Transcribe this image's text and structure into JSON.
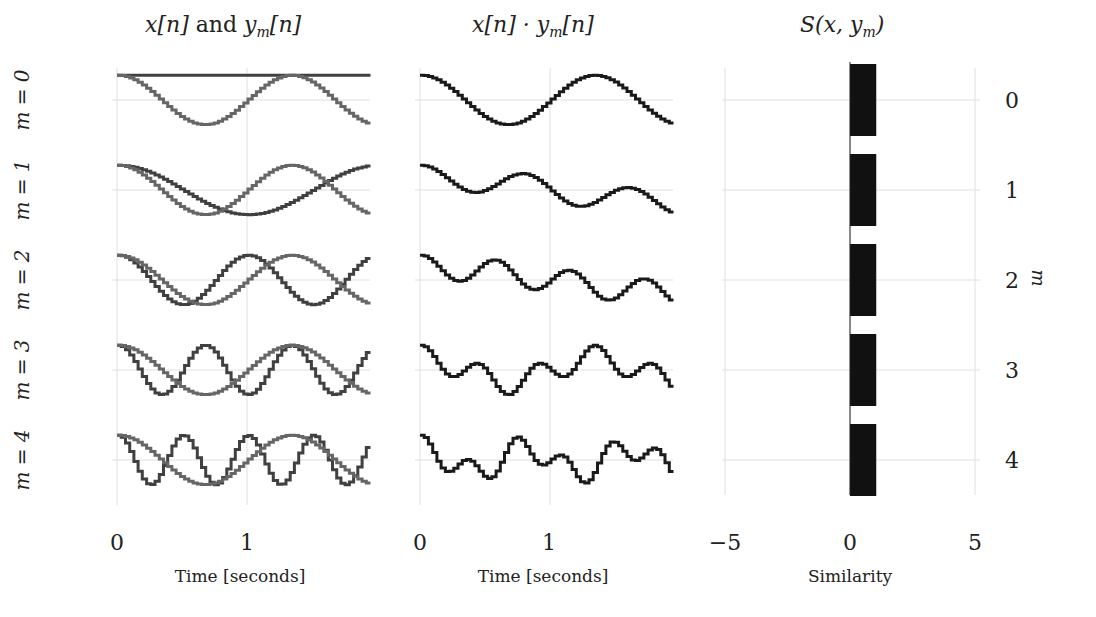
{
  "panels": {
    "left": {
      "title": "x[n] and y_m[n]",
      "title_parts": [
        "x[n]",
        " and ",
        "y",
        "m",
        "[n]"
      ],
      "xlabel": "Time [seconds]",
      "xticks": [
        "0",
        "1"
      ]
    },
    "middle": {
      "title": "x[n] · y_m[n]",
      "title_parts": [
        "x[n] · y",
        "m",
        "[n]"
      ],
      "xlabel": "Time [seconds]",
      "xticks": [
        "0",
        "1"
      ]
    },
    "right": {
      "title": "S(x, y_m)",
      "title_parts": [
        "S(x, y",
        "m",
        ")"
      ],
      "xlabel": "Similarity",
      "xticks": [
        "−5",
        "0",
        "5"
      ],
      "ylabel": "m",
      "yticks": [
        "0",
        "1",
        "2",
        "3",
        "4"
      ]
    }
  },
  "row_labels": [
    "m = 0",
    "m = 1",
    "m = 2",
    "m = 3",
    "m = 4"
  ],
  "colors": {
    "x_signal": "#4d4d4d",
    "y_signal": "#5a5a5a",
    "product": "#1a1a1a",
    "bar": "#111111",
    "grid": "#e0e0e0"
  },
  "chart_data": [
    {
      "type": "line",
      "title": "x[n] and y_m[n]",
      "xlabel": "Time [seconds]",
      "xlim": [
        0,
        1.95
      ],
      "xticks": [
        0,
        1
      ],
      "grid": true,
      "step_style": "stairs",
      "series": [
        {
          "name": "x[n]",
          "formula": "cos(2*pi*0.75*t)",
          "frequency_hz": 0.75
        },
        {
          "name": "y_0[n]",
          "formula": "cos(2*pi*0*t)",
          "frequency_hz": 0.0
        },
        {
          "name": "y_1[n]",
          "formula": "cos(2*pi*0.5*t)",
          "frequency_hz": 0.5
        },
        {
          "name": "y_2[n]",
          "formula": "cos(2*pi*1.0*t)",
          "frequency_hz": 1.0
        },
        {
          "name": "y_3[n]",
          "formula": "cos(2*pi*1.5*t)",
          "frequency_hz": 1.5
        },
        {
          "name": "y_4[n]",
          "formula": "cos(2*pi*2.0*t)",
          "frequency_hz": 2.0
        }
      ],
      "rows": [
        "m = 0",
        "m = 1",
        "m = 2",
        "m = 3",
        "m = 4"
      ]
    },
    {
      "type": "line",
      "title": "x[n] · y_m[n]",
      "xlabel": "Time [seconds]",
      "xlim": [
        0,
        1.95
      ],
      "xticks": [
        0,
        1
      ],
      "grid": true,
      "series": [
        {
          "name": "x·y_0",
          "m": 0
        },
        {
          "name": "x·y_1",
          "m": 1
        },
        {
          "name": "x·y_2",
          "m": 2
        },
        {
          "name": "x·y_3",
          "m": 3
        },
        {
          "name": "x·y_4",
          "m": 4
        }
      ]
    },
    {
      "type": "bar",
      "orientation": "horizontal",
      "title": "S(x, y_m)",
      "xlabel": "Similarity",
      "ylabel": "m",
      "categories": [
        "0",
        "1",
        "2",
        "3",
        "4"
      ],
      "values": [
        1.0,
        1.0,
        1.0,
        1.0,
        1.0
      ],
      "xlim": [
        -5,
        5
      ],
      "xticks": [
        -5,
        0,
        5
      ],
      "grid": true
    }
  ]
}
